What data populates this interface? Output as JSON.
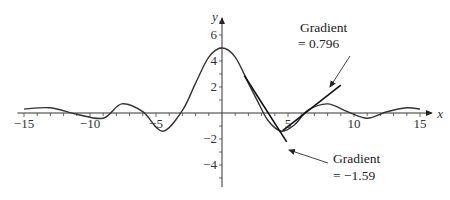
{
  "chart_data": {
    "type": "line",
    "title": "",
    "xlabel": "x",
    "ylabel": "y",
    "xlim": [
      -15.5,
      15.5
    ],
    "ylim": [
      -5.5,
      7.5
    ],
    "x_ticks": [
      -15,
      -10,
      -5,
      5,
      10,
      15
    ],
    "x_tick_labels": [
      "−15",
      "−10",
      "−5",
      "5",
      "10",
      "15"
    ],
    "y_ticks": [
      6,
      4,
      2,
      -2,
      -4
    ],
    "y_tick_labels": [
      "6",
      "4",
      "2",
      "−2",
      "−4"
    ],
    "grid": false,
    "series": [
      {
        "name": "y = f(x)",
        "x": [
          -15,
          -13,
          -11,
          -9,
          -7.6,
          -6,
          -4.5,
          -3,
          -2,
          -1,
          0,
          1,
          2,
          2.7,
          3.5,
          4.5,
          5.5,
          6.5,
          8,
          9.5,
          11,
          12.5,
          14,
          15
        ],
        "values": [
          0.3,
          0.4,
          -0.1,
          -0.4,
          0.7,
          0.1,
          -1.4,
          0.2,
          2.3,
          4.3,
          5,
          4.3,
          2.3,
          0.9,
          -0.6,
          -1.4,
          -0.9,
          0.2,
          0.7,
          0.1,
          -0.4,
          0.1,
          0.4,
          0.3
        ]
      }
    ],
    "tangents": [
      {
        "x0": 3.5,
        "y0": 0.0,
        "gradient": -1.59,
        "x_from": 1.7,
        "x_to": 4.9
      },
      {
        "x0": 6.3,
        "y0": 0.0,
        "gradient": 0.796,
        "x_from": 4.6,
        "x_to": 9.0
      }
    ],
    "annotations": [
      {
        "label_line1": "Gradient",
        "label_line2": "= 0.796",
        "points_to": "tangent-positive"
      },
      {
        "label_line1": "Gradient",
        "label_line2": "= −1.59",
        "points_to": "tangent-negative"
      }
    ]
  }
}
